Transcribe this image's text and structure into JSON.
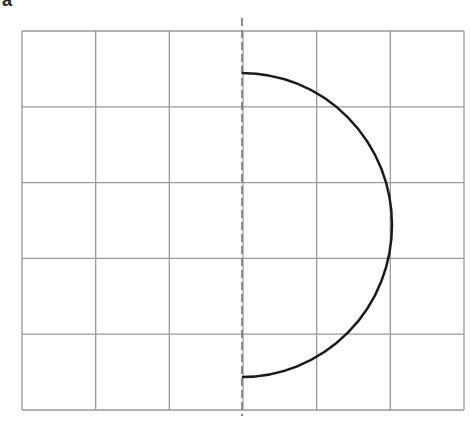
{
  "panel_label": "a",
  "grid": {
    "x0": 22,
    "x1": 464,
    "y0": 31,
    "y1": 410,
    "cols": 6,
    "rows": 5,
    "line_color": "#9a9a9a"
  },
  "axis_line": {
    "x": 242,
    "y0": 18,
    "y1": 416,
    "style": "dashed",
    "color": "#888888"
  },
  "semicircle": {
    "cx": 242,
    "cy": 225,
    "rx": 150,
    "ry": 152,
    "side": "right",
    "color": "#1a1a1a"
  }
}
